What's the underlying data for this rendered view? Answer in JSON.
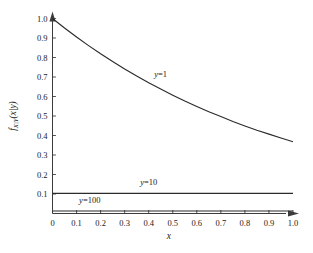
{
  "chart_data": {
    "type": "line",
    "title": "",
    "xlabel": "x",
    "ylabel": "f_X|Y(x|y)",
    "ylabel_parts": {
      "f": "f",
      "sub": "X|Y",
      "arg": "(x|y)"
    },
    "xlim": [
      0,
      1.0
    ],
    "ylim": [
      0,
      1.0
    ],
    "grid": false,
    "legend_position": "inline-annotations",
    "xticks": [
      "0",
      "0.1",
      "0.2",
      "0.3",
      "0.4",
      "0.5",
      "0.6",
      "0.7",
      "0.8",
      "0.9",
      "1.0"
    ],
    "xtick_values": [
      0,
      0.1,
      0.2,
      0.3,
      0.4,
      0.5,
      0.6,
      0.7,
      0.8,
      0.9,
      1.0
    ],
    "yticks": [
      "0.1",
      "0.2",
      "0.3",
      "0.4",
      "0.5",
      "0.6",
      "0.7",
      "0.8",
      "0.9",
      "1.0"
    ],
    "ytick_values": [
      0.1,
      0.2,
      0.3,
      0.4,
      0.5,
      0.6,
      0.7,
      0.8,
      0.9,
      1.0
    ],
    "series": [
      {
        "name": "y=1",
        "label": "y=1",
        "label_x": 0.45,
        "label_y": 0.7,
        "color": "#2b2b2b",
        "x": [
          0.0,
          0.05,
          0.1,
          0.15,
          0.2,
          0.25,
          0.3,
          0.35,
          0.4,
          0.45,
          0.5,
          0.55,
          0.6,
          0.65,
          0.7,
          0.75,
          0.8,
          0.85,
          0.9,
          0.95,
          1.0
        ],
        "values": [
          1.0,
          0.951,
          0.905,
          0.861,
          0.819,
          0.779,
          0.741,
          0.705,
          0.67,
          0.638,
          0.607,
          0.577,
          0.549,
          0.522,
          0.497,
          0.472,
          0.449,
          0.427,
          0.407,
          0.387,
          0.368
        ]
      },
      {
        "name": "y=10",
        "label": "y=10",
        "label_x": 0.4,
        "label_y": 0.145,
        "color": "#2b2b2b",
        "x": [
          0.0,
          0.1,
          0.2,
          0.3,
          0.4,
          0.5,
          0.6,
          0.7,
          0.8,
          0.9,
          1.0
        ],
        "values": [
          0.103,
          0.103,
          0.103,
          0.103,
          0.103,
          0.103,
          0.103,
          0.103,
          0.103,
          0.103,
          0.103
        ]
      },
      {
        "name": "y=100",
        "label": "y=100",
        "label_x": 0.155,
        "label_y": 0.055,
        "color": "#2b2b2b",
        "x": [
          0.0,
          0.1,
          0.2,
          0.3,
          0.4,
          0.5,
          0.6,
          0.7,
          0.8,
          0.9,
          1.0
        ],
        "values": [
          0.013,
          0.013,
          0.013,
          0.013,
          0.013,
          0.013,
          0.013,
          0.013,
          0.013,
          0.013,
          0.013
        ]
      }
    ],
    "colors": {
      "axis": "#3c3c3c",
      "curve": "#2b2b2b",
      "background": "#ffffff",
      "text": "#1a1a1a"
    }
  }
}
